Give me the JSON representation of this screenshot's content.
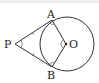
{
  "diagram": {
    "type": "geometry",
    "labels": {
      "P": "P",
      "A": "A",
      "B": "B",
      "O": "O"
    },
    "points": {
      "P": [
        15,
        44
      ],
      "A": [
        52,
        20
      ],
      "B": [
        52,
        67
      ],
      "O": [
        66,
        44
      ]
    },
    "circle": {
      "center": [
        67,
        44
      ],
      "radius": 27
    },
    "colors": {
      "line": "#333333",
      "background": "#ffffff",
      "topbar": "#ececec"
    }
  }
}
